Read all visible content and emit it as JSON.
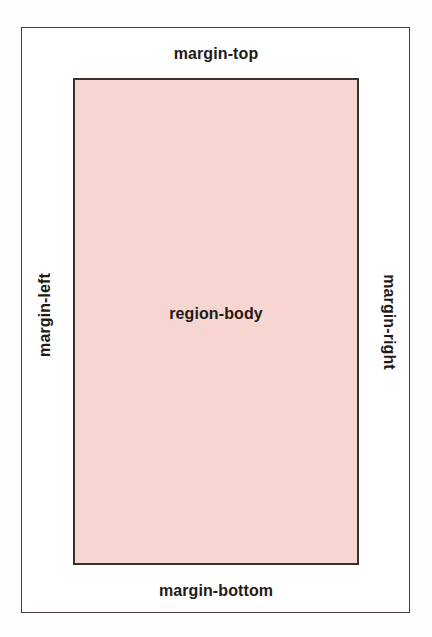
{
  "diagram": {
    "colors": {
      "canvas_background": "#fefefe",
      "page_box_background": "#ffffff",
      "page_box_border": "#4a3d37",
      "region_body_fill": "#f7d6d1",
      "region_body_border": "#3b302a",
      "label_text": "#231a15"
    },
    "page_box": {
      "label": "page-box"
    },
    "region_body": {
      "label": "region-body"
    },
    "margins": {
      "top": "margin-top",
      "right": "margin-right",
      "bottom": "margin-bottom",
      "left": "margin-left"
    }
  }
}
